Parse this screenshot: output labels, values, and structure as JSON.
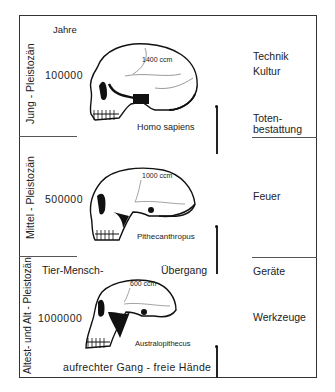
{
  "header": {
    "years_label": "Jahre"
  },
  "eras": [
    {
      "name": "Jung - Pleistozän",
      "years": "100000",
      "species": "Homo sapiens",
      "brain_volume": "1400 ccm"
    },
    {
      "name": "Mittel - Pleistozän",
      "years": "500000",
      "species": "Pithecanthropus",
      "brain_volume": "1000 ccm"
    },
    {
      "name": "Altest- und Alt - Pleistozän",
      "years": "1000000",
      "species": "Australopithecus",
      "brain_volume": "600 ccm"
    }
  ],
  "transition": {
    "left": "Tier-Mensch-",
    "right": "Übergang"
  },
  "bottom_caption": "aufrechter Gang - freie Hände",
  "right_column": {
    "technik": "Technik",
    "kultur": "Kultur",
    "toten1": "Toten-",
    "toten2": "bestattung",
    "feuer": "Feuer",
    "geraete": "Geräte",
    "werkzeuge": "Werkzeuge"
  }
}
